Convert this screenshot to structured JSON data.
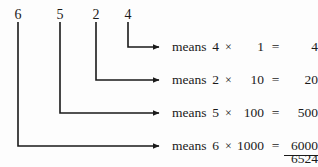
{
  "diagram": {
    "number": "6524",
    "digits": [
      {
        "value": "6",
        "x": 18,
        "y": 8
      },
      {
        "value": "5",
        "x": 60,
        "y": 8
      },
      {
        "value": "2",
        "x": 96,
        "y": 8
      },
      {
        "value": "4",
        "x": 128,
        "y": 8
      }
    ],
    "rows": [
      {
        "digit": "4",
        "means_label": "means",
        "factor": "4",
        "times_symbol": "×",
        "place_value": "1",
        "equals_symbol": "=",
        "result": "4",
        "stem_x": 128,
        "arrow_y": 47
      },
      {
        "digit": "2",
        "means_label": "means",
        "factor": "2",
        "times_symbol": "×",
        "place_value": "10",
        "equals_symbol": "=",
        "result": "20",
        "stem_x": 96,
        "arrow_y": 80
      },
      {
        "digit": "5",
        "means_label": "means",
        "factor": "5",
        "times_symbol": "×",
        "place_value": "100",
        "equals_symbol": "=",
        "result": "500",
        "stem_x": 60,
        "arrow_y": 113
      },
      {
        "digit": "6",
        "means_label": "means",
        "factor": "6",
        "times_symbol": "×",
        "place_value": "1000",
        "equals_symbol": "=",
        "result": "6000",
        "stem_x": 18,
        "arrow_y": 146
      }
    ],
    "sum": "6524",
    "stroke_color": "#1a1a1a",
    "background_color": "#fdfdfd",
    "arrow_tip_x": 166,
    "text_left": 172,
    "row_text_top": 39
  }
}
